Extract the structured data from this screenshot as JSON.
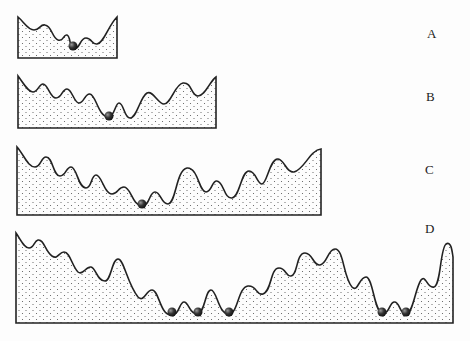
{
  "diagram": {
    "panels": [
      {
        "label": "A",
        "balls": 1
      },
      {
        "label": "B",
        "balls": 1
      },
      {
        "label": "C",
        "balls": 1
      },
      {
        "label": "D",
        "balls": 5
      }
    ],
    "colors": {
      "stroke": "#222222",
      "ball": "#333333",
      "stipple": "#555555",
      "background": "#fdfdfd"
    }
  }
}
